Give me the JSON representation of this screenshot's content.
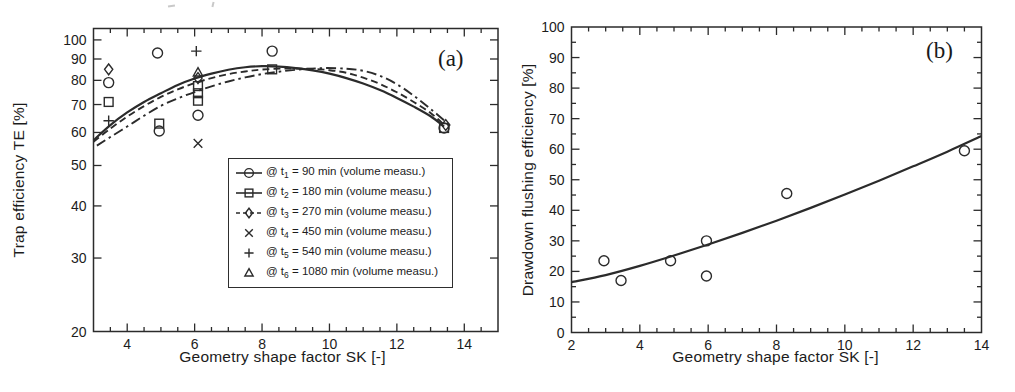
{
  "figure": {
    "paper_color": "#ffffff",
    "ink_color": "#2b2b2b",
    "text_color": "#1c1c1c"
  },
  "chart_data": [
    {
      "type": "scatter",
      "panel": "(a)",
      "xlabel": "Geometry shape factor SK [-]",
      "ylabel": "Trap efficiency TE [%]",
      "xlim": [
        3,
        15
      ],
      "ylim": [
        20,
        106.5
      ],
      "yscale": "log",
      "grid": false,
      "x_major_ticks": [
        4,
        6,
        8,
        10,
        12,
        14
      ],
      "x_minor_step": 0.5,
      "y_major_ticks": [
        20,
        30,
        40,
        50,
        60,
        70,
        80,
        90,
        100
      ],
      "legend_position": "inside-lower-right",
      "series": [
        {
          "name": "@ t1 = 90 min (volume measu.)",
          "label_pre": "@ t",
          "label_sub": "1",
          "label_post": " = 90 min (volume measu.)",
          "marker": "circle",
          "legend_line": "solid",
          "points": [
            [
              3.45,
              79
            ],
            [
              4.9,
              93
            ],
            [
              4.95,
              60.5
            ],
            [
              6.1,
              66
            ],
            [
              8.3,
              94
            ],
            [
              13.4,
              61.5
            ]
          ]
        },
        {
          "name": "@ t2 = 180 min (volume measu.)",
          "label_pre": "@ t",
          "label_sub": "2",
          "label_post": " = 180 min (volume measu.)",
          "marker": "square",
          "legend_line": "solid",
          "points": [
            [
              3.45,
              71
            ],
            [
              4.95,
              63
            ],
            [
              6.1,
              77.5
            ],
            [
              6.1,
              74.5
            ],
            [
              6.1,
              71.5
            ],
            [
              8.3,
              85
            ],
            [
              13.4,
              61.5
            ]
          ]
        },
        {
          "name": "@ t3 = 270 min (volume measu.)",
          "label_pre": "@ t",
          "label_sub": "3",
          "label_post": " = 270 min (volume measu.)",
          "marker": "diamond",
          "legend_line": "dashed",
          "points": [
            [
              3.45,
              85
            ],
            [
              6.1,
              81
            ],
            [
              13.45,
              62.5
            ]
          ]
        },
        {
          "name": "@ t4 = 450 min (volume measu.)",
          "label_pre": "@ t",
          "label_sub": "4",
          "label_post": " = 450 min (volume measu.)",
          "marker": "x",
          "legend_line": "none",
          "points": [
            [
              6.1,
              56.5
            ]
          ]
        },
        {
          "name": "@ t5 = 540 min (volume measu.)",
          "label_pre": "@ t",
          "label_sub": "5",
          "label_post": " = 540 min (volume measu.)",
          "marker": "plus",
          "legend_line": "none",
          "points": [
            [
              3.45,
              64
            ],
            [
              6.05,
              94
            ]
          ]
        },
        {
          "name": "@ t6 = 1080 min (volume measu.)",
          "label_pre": "@ t",
          "label_sub": "6",
          "label_post": " = 1080 min (volume measu.)",
          "marker": "triangle",
          "legend_line": "none",
          "points": [
            [
              6.1,
              83.5
            ]
          ]
        }
      ],
      "curves": [
        {
          "style": "solid",
          "points": [
            [
              3,
              57.5
            ],
            [
              3.5,
              62.5
            ],
            [
              4,
              67
            ],
            [
              4.5,
              71
            ],
            [
              5,
              74.5
            ],
            [
              5.5,
              78
            ],
            [
              6,
              80.8
            ],
            [
              6.5,
              83
            ],
            [
              7,
              84.8
            ],
            [
              7.5,
              86
            ],
            [
              8,
              86.5
            ],
            [
              8.5,
              86.3
            ],
            [
              9,
              85.6
            ],
            [
              9.5,
              84.5
            ],
            [
              10,
              83
            ],
            [
              10.5,
              81
            ],
            [
              11,
              78.6
            ],
            [
              11.5,
              75.8
            ],
            [
              12,
              72.6
            ],
            [
              12.5,
              69.2
            ],
            [
              13,
              65.6
            ],
            [
              13.4,
              62
            ]
          ]
        },
        {
          "style": "dashed",
          "points": [
            [
              3,
              57
            ],
            [
              3.5,
              61.3
            ],
            [
              4,
              65.5
            ],
            [
              4.5,
              69.4
            ],
            [
              5,
              73
            ],
            [
              5.5,
              76.1
            ],
            [
              6,
              78.8
            ],
            [
              6.5,
              81
            ],
            [
              7,
              82.8
            ],
            [
              7.5,
              84
            ],
            [
              8,
              84.9
            ],
            [
              8.7,
              85.4
            ],
            [
              9.5,
              85.2
            ],
            [
              10,
              84.6
            ],
            [
              10.5,
              83.4
            ],
            [
              11,
              81.2
            ],
            [
              11.5,
              78.4
            ],
            [
              12,
              74.9
            ],
            [
              12.5,
              71
            ],
            [
              13,
              66.8
            ],
            [
              13.4,
              62.6
            ]
          ]
        },
        {
          "style": "dashdot",
          "points": [
            [
              3.1,
              55.8
            ],
            [
              3.5,
              58.5
            ],
            [
              4,
              62
            ],
            [
              4.5,
              65.8
            ],
            [
              5,
              69.5
            ],
            [
              5.5,
              72.4
            ],
            [
              6,
              75
            ],
            [
              6.5,
              77.4
            ],
            [
              7,
              79.5
            ],
            [
              7.5,
              81.3
            ],
            [
              8,
              82.8
            ],
            [
              8.5,
              83.9
            ],
            [
              9,
              84.8
            ],
            [
              9.8,
              85.6
            ],
            [
              10.5,
              85.3
            ],
            [
              11,
              84.3
            ],
            [
              11.5,
              82
            ],
            [
              12,
              78.3
            ],
            [
              12.5,
              73.5
            ],
            [
              13,
              68.3
            ],
            [
              13.5,
              63.2
            ]
          ]
        }
      ]
    },
    {
      "type": "scatter",
      "panel": "(b)",
      "xlabel": "Geometry shape factor SK [-]",
      "ylabel": "Drawdown flushing efficiency [%]",
      "xlim": [
        2,
        14
      ],
      "ylim": [
        0,
        100
      ],
      "yscale": "linear",
      "grid": false,
      "x_major_ticks": [
        2,
        4,
        6,
        8,
        10,
        12,
        14
      ],
      "x_minor_step": 0.5,
      "y_major_ticks": [
        0,
        10,
        20,
        30,
        40,
        50,
        60,
        70,
        80,
        90,
        100
      ],
      "y_minor_step": 5,
      "series": [
        {
          "marker": "circle",
          "legend_line": "none",
          "points": [
            [
              2.95,
              23.5
            ],
            [
              3.45,
              17
            ],
            [
              4.9,
              23.5
            ],
            [
              5.95,
              30
            ],
            [
              5.95,
              18.5
            ],
            [
              8.3,
              45.5
            ],
            [
              13.5,
              59.5
            ]
          ]
        }
      ],
      "curves": [
        {
          "style": "solid",
          "points": [
            [
              2,
              16.5
            ],
            [
              3,
              18.8
            ],
            [
              4,
              21.8
            ],
            [
              5,
              25.2
            ],
            [
              6,
              28.8
            ],
            [
              7,
              32.6
            ],
            [
              8,
              36.6
            ],
            [
              9,
              40.8
            ],
            [
              10,
              45.2
            ],
            [
              11,
              49.7
            ],
            [
              12,
              54.4
            ],
            [
              13,
              59.2
            ],
            [
              14,
              64.3
            ]
          ]
        }
      ]
    }
  ]
}
